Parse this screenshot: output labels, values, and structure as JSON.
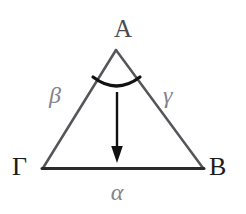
{
  "figure": {
    "kind": "geometry-triangle-diagram",
    "canvas": {
      "width": 246,
      "height": 214,
      "background": "#ffffff"
    },
    "vertices": {
      "apex": {
        "label": "A",
        "x": 116,
        "y": 50
      },
      "left": {
        "label": "Γ",
        "x": 43,
        "y": 168
      },
      "right": {
        "label": "B",
        "x": 203,
        "y": 168
      }
    },
    "sides": {
      "base": {
        "label": "α",
        "from": "Γ",
        "to": "B",
        "color": "#2a2a2a",
        "width": 3
      },
      "left": {
        "label": "β",
        "from": "Γ",
        "to": "A",
        "color": "#55555a",
        "width": 2.5
      },
      "right": {
        "label": "γ",
        "from": "A",
        "to": "B",
        "color": "#55555a",
        "width": 2.5
      }
    },
    "angle_arc": {
      "name": "apex-angle-arc",
      "at_vertex": "A",
      "color": "#111111",
      "width": 3.2,
      "start_x": 93,
      "start_y": 77,
      "end_x": 140,
      "end_y": 77,
      "sag_y": 90
    },
    "arrow": {
      "name": "height-arrow",
      "direction": "down",
      "color": "#111111",
      "width": 2.4,
      "x": 117,
      "y_start": 92,
      "y_end": 162,
      "head_width": 11,
      "head_length": 15
    },
    "labels": {
      "vertex_a": "A",
      "vertex_gamma": "Γ",
      "vertex_b": "B",
      "side_alpha": "α",
      "side_beta": "β",
      "side_gamma": "γ"
    }
  }
}
